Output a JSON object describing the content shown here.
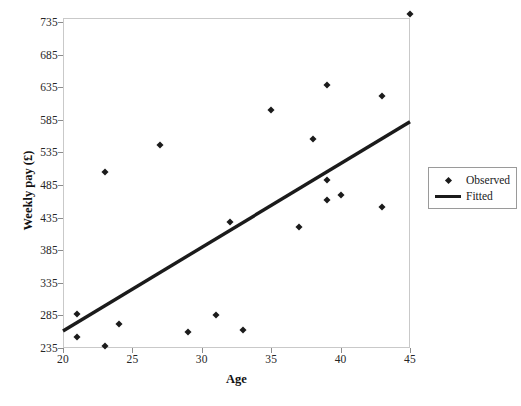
{
  "chart_data": {
    "type": "scatter",
    "title": "",
    "xlabel": "Age",
    "ylabel": "Weekly pay (£)",
    "xlim": [
      20,
      45
    ],
    "ylim": [
      235,
      748
    ],
    "grid": false,
    "legend_position": "right",
    "xticks": [
      20,
      25,
      30,
      35,
      40,
      45
    ],
    "yticks": [
      235,
      285,
      335,
      385,
      435,
      485,
      535,
      585,
      635,
      685,
      735
    ],
    "series": [
      {
        "name": "Observed",
        "type": "scatter",
        "marker": "diamond",
        "color": "#1b1b1b",
        "points": [
          {
            "x": 21,
            "y": 287
          },
          {
            "x": 21,
            "y": 252
          },
          {
            "x": 23,
            "y": 505
          },
          {
            "x": 23,
            "y": 238
          },
          {
            "x": 24,
            "y": 272
          },
          {
            "x": 27,
            "y": 546
          },
          {
            "x": 29,
            "y": 260
          },
          {
            "x": 31,
            "y": 285
          },
          {
            "x": 32,
            "y": 428
          },
          {
            "x": 33,
            "y": 262
          },
          {
            "x": 35,
            "y": 600
          },
          {
            "x": 37,
            "y": 421
          },
          {
            "x": 38,
            "y": 555
          },
          {
            "x": 39,
            "y": 638
          },
          {
            "x": 39,
            "y": 492
          },
          {
            "x": 39,
            "y": 462
          },
          {
            "x": 40,
            "y": 470
          },
          {
            "x": 43,
            "y": 622
          },
          {
            "x": 43,
            "y": 452
          },
          {
            "x": 45,
            "y": 748
          }
        ]
      },
      {
        "name": "Fitted",
        "type": "line",
        "color": "#1b1b1b",
        "points": [
          {
            "x": 20,
            "y": 261
          },
          {
            "x": 45,
            "y": 582
          }
        ]
      }
    ],
    "legend": [
      {
        "label": "Observed",
        "key": "diamond-marker"
      },
      {
        "label": "Fitted",
        "key": "line-swatch"
      }
    ]
  },
  "axes": {
    "x_title": "Age",
    "y_title": "Weekly pay (£)"
  }
}
